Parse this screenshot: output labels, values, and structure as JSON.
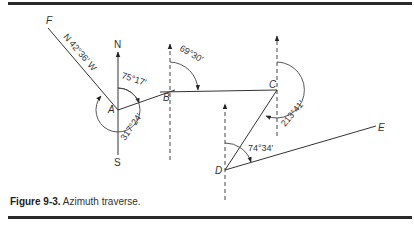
{
  "figure": {
    "number_label": "Figure 9-3.",
    "caption": "Azimuth traverse."
  },
  "points": {
    "A": "A",
    "B": "B",
    "C": "C",
    "D": "D",
    "E": "E",
    "F": "F"
  },
  "directions": {
    "north": "N",
    "south": "S"
  },
  "bearings": {
    "AF": "N 42°36′ W"
  },
  "angles": {
    "A_to_B": "75°17′",
    "A_to_F": "317°24′",
    "B_to_C": "69°30′",
    "C_to_D": "213°41′",
    "D_to_E": "74°34′"
  },
  "colors": {
    "line": "#333333",
    "rule": "#2a2a2a",
    "background": "#ffffff"
  }
}
